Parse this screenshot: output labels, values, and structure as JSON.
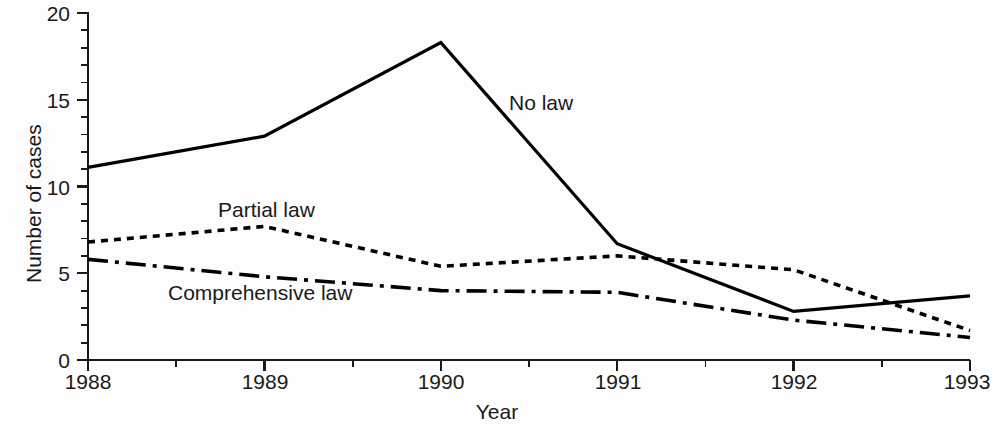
{
  "chart_data": {
    "type": "line",
    "title": "",
    "xlabel": "Year",
    "ylabel": "Number of cases",
    "x": [
      1988,
      1989,
      1990,
      1991,
      1992,
      1993
    ],
    "categories": [
      "1988",
      "1989",
      "1990",
      "1991",
      "1992",
      "1993"
    ],
    "xlim": [
      1988,
      1993
    ],
    "ylim": [
      0,
      20
    ],
    "xticks": [
      "1988",
      "1989",
      "1990",
      "1991",
      "1992",
      "1993"
    ],
    "yticks": [
      "0",
      "5",
      "10",
      "15",
      "20"
    ],
    "y_minor_tick_step": 1,
    "x_minor_tick_step": 0.5,
    "grid": false,
    "legend_position": "inline-annotations",
    "series": [
      {
        "name": "No law",
        "style": "solid",
        "color": "#000000",
        "values": [
          11.1,
          12.9,
          18.3,
          6.7,
          2.8,
          3.7
        ]
      },
      {
        "name": "Partial law",
        "style": "dotted",
        "color": "#000000",
        "values": [
          6.8,
          7.7,
          5.4,
          6.0,
          5.2,
          1.7
        ]
      },
      {
        "name": "Comprehensive law",
        "style": "dash-dot",
        "color": "#000000",
        "values": [
          5.8,
          4.8,
          4.0,
          3.9,
          2.3,
          1.3
        ]
      }
    ],
    "annotations": [
      {
        "text": "No law",
        "x": 1990.9,
        "y": 15.5
      },
      {
        "text": "Partial law",
        "x": 1989.2,
        "y": 9.5
      },
      {
        "text": "Comprehensive law",
        "x": 1988.6,
        "y": 4.7
      }
    ]
  },
  "axes": {
    "y_tick_0": "0",
    "y_tick_5": "5",
    "y_tick_10": "10",
    "y_tick_15": "15",
    "y_tick_20": "20",
    "x_tick_1988": "1988",
    "x_tick_1989": "1989",
    "x_tick_1990": "1990",
    "x_tick_1991": "1991",
    "x_tick_1992": "1992",
    "x_tick_1993": "1993",
    "x_title": "Year",
    "y_title": "Number of cases"
  },
  "labels": {
    "no_law": "No law",
    "partial_law": "Partial law",
    "comprehensive_law": "Comprehensive law"
  },
  "colors": {
    "axis": "#1a1a1a",
    "series": "#000000",
    "background": "#fdfdfd"
  }
}
